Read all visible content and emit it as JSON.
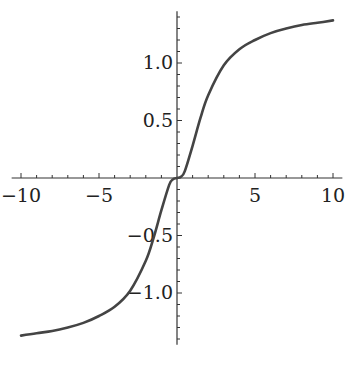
{
  "chart_data": {
    "type": "line",
    "title": "",
    "xlabel": "",
    "ylabel": "",
    "xlim": [
      -10.5,
      10.5
    ],
    "ylim": [
      -1.45,
      1.45
    ],
    "grid": false,
    "legend": null,
    "x_ticks": [
      -10,
      -5,
      5,
      10
    ],
    "x_tick_labels": [
      "−10",
      "−5",
      "5",
      "10"
    ],
    "y_ticks": [
      -1.0,
      -0.5,
      0.5,
      1.0
    ],
    "y_tick_labels": [
      "−1.0",
      "−0.5",
      "0.5",
      "1.0"
    ],
    "series": [
      {
        "name": "f(x)",
        "color": "#444444",
        "x": [
          -10,
          -9,
          -8,
          -7,
          -6,
          -5,
          -4,
          -3,
          -2,
          -1.5,
          -1,
          -0.5,
          -0.25,
          0,
          0.25,
          0.5,
          1,
          1.5,
          2,
          3,
          4,
          5,
          6,
          7,
          8,
          9,
          10
        ],
        "y": [
          -1.37,
          -1.35,
          -1.33,
          -1.3,
          -1.26,
          -1.2,
          -1.12,
          -0.98,
          -0.72,
          -0.52,
          -0.28,
          -0.06,
          -0.01,
          0,
          0.01,
          0.06,
          0.28,
          0.52,
          0.72,
          0.98,
          1.12,
          1.2,
          1.26,
          1.3,
          1.33,
          1.35,
          1.37
        ]
      }
    ]
  }
}
